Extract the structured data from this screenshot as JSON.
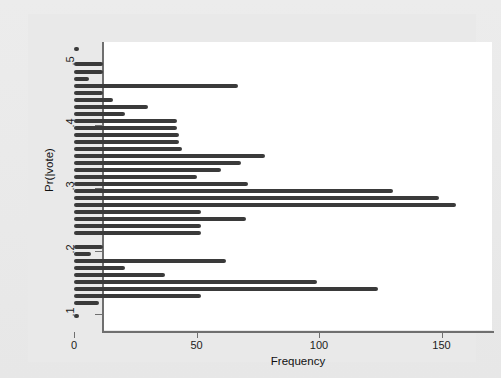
{
  "figure": {
    "background_color": "#eaeaea",
    "plot_background_color": "#ffffff",
    "bar_color": "#3a3a3a",
    "axis_color": "#6f6f6f"
  },
  "axes": {
    "x_title": "Frequency",
    "y_title": "Pr(|vote)",
    "x_ticks": [
      "0",
      "50",
      "100",
      "150"
    ],
    "x_tick_values": [
      0,
      50,
      100,
      150
    ],
    "y_ticks": [
      ".1",
      ".2",
      ".3",
      ".4",
      ".5"
    ],
    "y_tick_values": [
      0.1,
      0.2,
      0.3,
      0.4,
      0.5
    ]
  },
  "chart_data": {
    "type": "bar",
    "orientation": "horizontal",
    "title": "",
    "subtitle": "",
    "xlabel": "Frequency",
    "ylabel": "Pr(|vote)",
    "xlim": [
      0,
      162
    ],
    "ylim": [
      0.095,
      0.555
    ],
    "grid": false,
    "legend": null,
    "annotations": [],
    "note": "Histogram of predicted probabilities Pr(vote): horizontal frequency bars, one per probability bin from about .10 to .54.",
    "categories": [
      0.54,
      0.525,
      0.515,
      0.505,
      0.495,
      0.485,
      0.475,
      0.465,
      0.455,
      0.445,
      0.435,
      0.425,
      0.415,
      0.405,
      0.395,
      0.385,
      0.375,
      0.365,
      0.355,
      0.345,
      0.335,
      0.325,
      0.315,
      0.305,
      0.295,
      0.285,
      0.275,
      0.265,
      0.255,
      0.245,
      0.225,
      0.215,
      0.205,
      0.195,
      0.185,
      0.175,
      0.165,
      0.155,
      0.145,
      0.135,
      0.125,
      0.105
    ],
    "values": [
      2,
      12,
      12,
      6,
      67,
      12,
      16,
      30,
      21,
      42,
      42,
      43,
      78,
      68,
      60,
      50,
      71,
      130,
      149,
      156,
      52,
      70,
      52,
      52,
      52,
      52,
      52,
      52,
      52,
      52,
      12,
      7,
      62,
      21,
      37,
      37,
      99,
      124,
      52,
      52,
      10,
      2
    ],
    "series": [
      {
        "name": "Frequency",
        "bins": [
          {
            "y": 0.54,
            "frequency": 2
          },
          {
            "y": 0.523,
            "frequency": 12
          },
          {
            "y": 0.514,
            "frequency": 12
          },
          {
            "y": 0.505,
            "frequency": 6
          },
          {
            "y": 0.493,
            "frequency": 67
          },
          {
            "y": 0.483,
            "frequency": 12
          },
          {
            "y": 0.473,
            "frequency": 16
          },
          {
            "y": 0.463,
            "frequency": 30
          },
          {
            "y": 0.453,
            "frequency": 21
          },
          {
            "y": 0.443,
            "frequency": 42
          },
          {
            "y": 0.433,
            "frequency": 42
          },
          {
            "y": 0.422,
            "frequency": 43
          },
          {
            "y": 0.412,
            "frequency": 43
          },
          {
            "y": 0.402,
            "frequency": 44
          },
          {
            "y": 0.392,
            "frequency": 78
          },
          {
            "y": 0.382,
            "frequency": 68
          },
          {
            "y": 0.372,
            "frequency": 60
          },
          {
            "y": 0.362,
            "frequency": 50
          },
          {
            "y": 0.352,
            "frequency": 71
          },
          {
            "y": 0.341,
            "frequency": 130
          },
          {
            "y": 0.331,
            "frequency": 149
          },
          {
            "y": 0.321,
            "frequency": 156
          },
          {
            "y": 0.311,
            "frequency": 52
          },
          {
            "y": 0.301,
            "frequency": 70
          },
          {
            "y": 0.291,
            "frequency": 52
          },
          {
            "y": 0.281,
            "frequency": 52
          },
          {
            "y": 0.253,
            "frequency": 12
          },
          {
            "y": 0.243,
            "frequency": 7
          },
          {
            "y": 0.233,
            "frequency": 62
          },
          {
            "y": 0.223,
            "frequency": 21
          },
          {
            "y": 0.213,
            "frequency": 37
          },
          {
            "y": 0.203,
            "frequency": 99
          },
          {
            "y": 0.193,
            "frequency": 124
          },
          {
            "y": 0.183,
            "frequency": 52
          },
          {
            "y": 0.173,
            "frequency": 10
          },
          {
            "y": 0.163,
            "frequency": 2
          }
        ]
      }
    ]
  },
  "bars": [
    {
      "y": 35,
      "value": 2
    },
    {
      "y": 52,
      "value": 12
    },
    {
      "y": 60,
      "value": 12
    },
    {
      "y": 68,
      "value": 6
    },
    {
      "y": 76,
      "value": 67
    },
    {
      "y": 84,
      "value": 12
    },
    {
      "y": 92,
      "value": 16
    },
    {
      "y": 100,
      "value": 30
    },
    {
      "y": 108,
      "value": 21
    },
    {
      "y": 116,
      "value": 42
    },
    {
      "y": 124,
      "value": 42
    },
    {
      "y": 132,
      "value": 43
    },
    {
      "y": 140,
      "value": 43
    },
    {
      "y": 148,
      "value": 44
    },
    {
      "y": 140,
      "value": 78
    },
    {
      "y": 148,
      "value": 68
    },
    {
      "y": 156,
      "value": 60
    },
    {
      "y": 164,
      "value": 50
    },
    {
      "y": 172,
      "value": 71
    },
    {
      "y": 180,
      "value": 130
    },
    {
      "y": 188,
      "value": 149
    },
    {
      "y": 196,
      "value": 156
    },
    {
      "y": 204,
      "value": 52
    },
    {
      "y": 212,
      "value": 70
    },
    {
      "y": 220,
      "value": 52
    },
    {
      "y": 228,
      "value": 52
    },
    {
      "y": 244,
      "value": 12
    },
    {
      "y": 252,
      "value": 7
    },
    {
      "y": 260,
      "value": 62
    },
    {
      "y": 268,
      "value": 21
    },
    {
      "y": 276,
      "value": 37
    },
    {
      "y": 284,
      "value": 99
    },
    {
      "y": 292,
      "value": 124
    },
    {
      "y": 300,
      "value": 52
    },
    {
      "y": 308,
      "value": 10
    },
    {
      "y": 314,
      "value": 2
    }
  ],
  "bar_rows": [
    {
      "top": 33,
      "value": 2
    },
    {
      "top": 48,
      "value": 12
    },
    {
      "top": 56,
      "value": 12
    },
    {
      "top": 63,
      "value": 6
    },
    {
      "top": 70,
      "value": 67
    },
    {
      "top": 77,
      "value": 12
    },
    {
      "top": 84,
      "value": 16
    },
    {
      "top": 91,
      "value": 30
    },
    {
      "top": 98,
      "value": 21
    },
    {
      "top": 105,
      "value": 42
    },
    {
      "top": 112,
      "value": 42
    },
    {
      "top": 119,
      "value": 43
    },
    {
      "top": 126,
      "value": 43
    },
    {
      "top": 133,
      "value": 44
    },
    {
      "top": 140,
      "value": 78
    },
    {
      "top": 147,
      "value": 68
    },
    {
      "top": 154,
      "value": 60
    },
    {
      "top": 161,
      "value": 50
    },
    {
      "top": 168,
      "value": 71
    },
    {
      "top": 175,
      "value": 130
    },
    {
      "top": 182,
      "value": 149
    },
    {
      "top": 189,
      "value": 156
    },
    {
      "top": 196,
      "value": 52
    },
    {
      "top": 203,
      "value": 70
    },
    {
      "top": 210,
      "value": 52
    },
    {
      "top": 217,
      "value": 52
    },
    {
      "top": 231,
      "value": 12
    },
    {
      "top": 238,
      "value": 7
    },
    {
      "top": 245,
      "value": 62
    },
    {
      "top": 252,
      "value": 21
    },
    {
      "top": 259,
      "value": 37
    },
    {
      "top": 266,
      "value": 99
    },
    {
      "top": 273,
      "value": 124
    },
    {
      "top": 280,
      "value": 52
    },
    {
      "top": 287,
      "value": 10
    },
    {
      "top": 300,
      "value": 2
    }
  ]
}
